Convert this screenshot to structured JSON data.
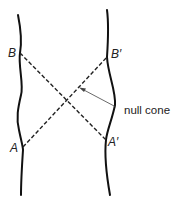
{
  "diagram": {
    "type": "spacetime-worldlines",
    "labels": {
      "B": "B",
      "A": "A",
      "B_prime": "B′",
      "A_prime": "A′",
      "callout": "null cone"
    },
    "worldlines": [
      {
        "id": "left",
        "passes_through": [
          "B",
          "A"
        ]
      },
      {
        "id": "right",
        "passes_through": [
          "B′",
          "A′"
        ]
      }
    ],
    "null_rays": [
      {
        "from": "B",
        "to": "A′",
        "style": "dashed"
      },
      {
        "from": "A",
        "to": "B′",
        "style": "dashed"
      }
    ],
    "annotation": {
      "text": "null cone",
      "points_to": "null ray A→B′"
    },
    "colors": {
      "line": "#111111",
      "dash": "#222222",
      "pointer": "#444444",
      "background": "#ffffff"
    }
  }
}
